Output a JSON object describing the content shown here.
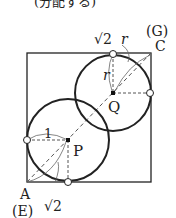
{
  "header": {
    "partial_text": "(分配する)"
  },
  "diagram": {
    "square": {
      "x": 27,
      "y": 53,
      "w": 124,
      "h": 129
    },
    "circle_P": {
      "cx": 68,
      "cy": 140,
      "r": 41,
      "center_label": "P"
    },
    "circle_Q": {
      "cx": 113,
      "cy": 93,
      "r": 38,
      "center_label": "Q"
    },
    "labels": {
      "corner_A": "A",
      "corner_A_alt": "(E)",
      "corner_C": "C",
      "corner_C_alt": "(G)",
      "radius_P": "1",
      "radius_Q": "r",
      "dist_A": "√2",
      "dist_C_sqrt": "√2",
      "dist_C_var": "r"
    },
    "colors": {
      "stroke": "#222222",
      "dashed": "#555555",
      "background": "#ffffff"
    }
  }
}
